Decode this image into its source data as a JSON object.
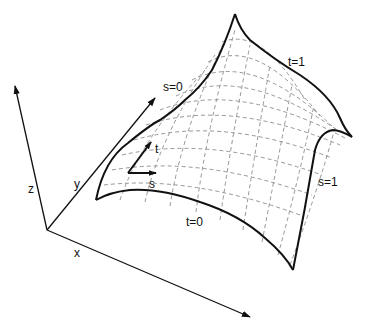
{
  "diagram": {
    "axes": {
      "x_label": "x",
      "y_label": "y",
      "z_label": "z"
    },
    "boundary_labels": {
      "s0": "s=0",
      "s1": "s=1",
      "t0": "t=0",
      "t1": "t=1"
    },
    "tangent_labels": {
      "s": "s",
      "t": "t"
    },
    "colors": {
      "ink": "#111111",
      "grid": "#8a8a8a",
      "background": "#ffffff"
    }
  }
}
